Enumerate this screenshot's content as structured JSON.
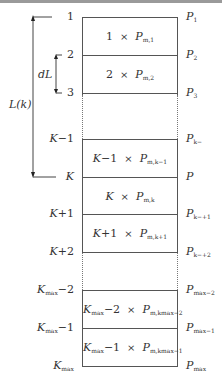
{
  "diagram": {
    "type": "layered column partition",
    "levels_left": [
      "1",
      "2",
      "3",
      "K−1",
      "K",
      "K+1",
      "K+2",
      "Kmax−2",
      "Kmax−1",
      "Kmax"
    ],
    "levels_right": [
      "P1",
      "P2",
      "P3",
      "Pk−1",
      "P",
      "Pk+1",
      "Pk+2",
      "Pmax−2",
      "Pmax−1",
      "Pmax"
    ],
    "cells": [
      {
        "index": "1",
        "var": "P",
        "sub": "m,1"
      },
      {
        "index": "2",
        "var": "P",
        "sub": "m,2"
      },
      {
        "index": "K−1",
        "var": "P",
        "sub": "m,k−1"
      },
      {
        "index": "K",
        "var": "P",
        "sub": "m,k"
      },
      {
        "index": "K+1",
        "var": "P",
        "sub": "m,k+1"
      },
      {
        "index": "Kmax−2",
        "var": "P",
        "sub": "m,kmax−2"
      },
      {
        "index": "Kmax−1",
        "var": "P",
        "sub": "m,kmax−1"
      }
    ],
    "times_symbol": "×",
    "annotations": {
      "dL": "dL",
      "Lk": "L(k)"
    }
  },
  "labels": {
    "l1": "1",
    "l2": "2",
    "l3": "3",
    "lKm1_base": "K",
    "lKm1_suffix": "−1",
    "lK": "K",
    "lKp1_base": "K",
    "lKp1_suffix": "+1",
    "lKp2_base": "K",
    "lKp2_suffix": "+2",
    "lKmax_base": "K",
    "lKmax_sub": "max",
    "lKmaxm2_suffix": "−2",
    "lKmaxm1_suffix": "−1",
    "P": "P",
    "r1_sub": "1",
    "r2_sub": "2",
    "r3_sub": "3",
    "rkm1_sub": "k−",
    "rkp1_sub": "k−+1",
    "rkp2_sub": "k−+2",
    "rmaxm2_sub": "max−2",
    "rmaxm1_sub": "max−1",
    "rmax_sub": "max",
    "times": "×",
    "c1_idx": "1",
    "c1_sub": "m,1",
    "c2_idx": "2",
    "c2_sub": "m,2",
    "ck_idx": "K",
    "ckm1_suffix": "−1",
    "ckm1_sub": "m,k−1",
    "ck_sub": "m,k",
    "ckp1_suffix": "+1",
    "ckp1_sub": "m,k+1",
    "cmaxm2_suffix": "−2",
    "cmaxm2_sub": "m,kmax−2",
    "cmaxm1_suffix": "−1",
    "cmaxm1_sub": "m,kmax−1",
    "dL": "dL",
    "Lk": "L(k)"
  }
}
